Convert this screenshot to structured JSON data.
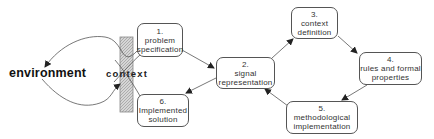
{
  "diagram": {
    "left_label": "environment",
    "boundary_label": "context",
    "steps": [
      {
        "id": 1,
        "number": "1.",
        "lines": [
          "problem",
          "specification"
        ]
      },
      {
        "id": 2,
        "number": "2.",
        "lines": [
          "signal",
          "representation"
        ]
      },
      {
        "id": 3,
        "number": "3.",
        "lines": [
          "context",
          "definition"
        ]
      },
      {
        "id": 4,
        "number": "4.",
        "lines": [
          "rules and formal",
          "properties"
        ]
      },
      {
        "id": 5,
        "number": "5.",
        "lines": [
          "methodological",
          "implementation"
        ]
      },
      {
        "id": 6,
        "number": "6.",
        "lines": [
          "Implemented",
          "solution"
        ]
      }
    ],
    "flow": [
      "environment -> 1",
      "1 -> 2",
      "2 -> 3",
      "3 -> 4",
      "4 -> 5",
      "5 -> 2",
      "2 -> 6",
      "6 -> environment"
    ],
    "colors": {
      "stroke": "#555555",
      "hatch": "#bdbdbd",
      "text": "#333333"
    }
  }
}
